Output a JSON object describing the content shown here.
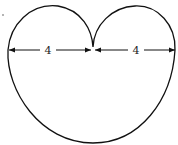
{
  "diagram": {
    "shape": "cardioid",
    "left_dimension": "4",
    "right_dimension": "4",
    "stroke_color": "#111111",
    "background": "#ffffff"
  }
}
